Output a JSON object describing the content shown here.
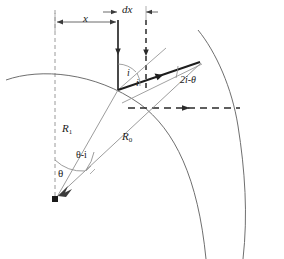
{
  "figure": {
    "type": "optics-ray-diagram",
    "colors": {
      "stroke_thin": "#7a7a7a",
      "stroke_bold": "#1a1a1a",
      "dashed_axis": "#9a9a9a",
      "text": "#1a1a1a",
      "background": "#ffffff"
    }
  },
  "labels": {
    "dx": "dx",
    "x": "x",
    "incidence_upper": "i",
    "incidence_lower": "i",
    "deviation": "2i-θ",
    "radius_inner": "R",
    "radius_inner_sub": "1",
    "radius_outer": "R",
    "radius_outer_sub": "0",
    "theta": "θ",
    "theta_minus_i": "θ-i"
  },
  "geometry": {
    "center_vertex": {
      "x": 55,
      "y": 200
    },
    "surface_vertex": {
      "x": 118,
      "y": 90
    },
    "outer_hit": {
      "x": 200,
      "y": 63
    },
    "axis_x": 55,
    "incident_ray_x": 118,
    "dashed_ray_x": 146,
    "dim_line_y": 22,
    "dx_line_y": 12,
    "horizontal_dash_y": 108
  }
}
